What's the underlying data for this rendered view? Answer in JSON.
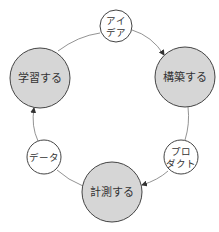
{
  "diagram": {
    "type": "cycle",
    "colors": {
      "stage_fill": "#d6d6d6",
      "artifact_fill": "#ffffff",
      "stroke": "#444444",
      "connector": "#777777",
      "text": "#333333"
    },
    "stages": {
      "build": {
        "label": "構築する"
      },
      "measure": {
        "label": "計測する"
      },
      "learn": {
        "label": "学習する"
      }
    },
    "artifacts": {
      "ideas": {
        "line1": "アイ",
        "line2": "デア"
      },
      "product": {
        "line1": "プロ",
        "line2": "ダクト"
      },
      "data": {
        "label": "データ"
      }
    },
    "flow": [
      "アイデア",
      "構築する",
      "プロダクト",
      "計測する",
      "データ",
      "学習する"
    ]
  }
}
